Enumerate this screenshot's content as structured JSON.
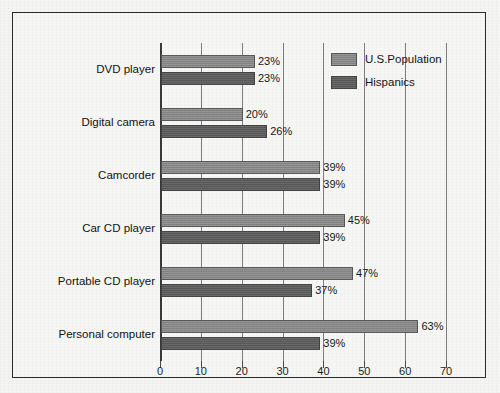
{
  "chart_data": {
    "type": "bar",
    "orientation": "horizontal",
    "title": "",
    "subtitle": "",
    "xlabel": "",
    "ylabel": "",
    "xlim": [
      0,
      70
    ],
    "xticks": [
      0,
      10,
      20,
      30,
      40,
      50,
      60,
      70
    ],
    "xtick_labels": [
      "0",
      "10",
      "20",
      "30",
      "40",
      "50",
      "60",
      "70"
    ],
    "grid": true,
    "grid_axis": "x",
    "legend_position": "top-right",
    "value_label_suffix": "%",
    "categories": [
      "DVD player",
      "Digital camera",
      "Camcorder",
      "Car CD player",
      "Portable CD player",
      "Personal computer"
    ],
    "series": [
      {
        "name": "U.S.Population",
        "color": "#8a8a8a",
        "values": [
          23,
          20,
          39,
          45,
          47,
          63
        ],
        "value_labels": [
          "23%",
          "20%",
          "39%",
          "45%",
          "47%",
          "63%"
        ]
      },
      {
        "name": "Hispanics",
        "color": "#5e5e5e",
        "values": [
          23,
          26,
          39,
          39,
          37,
          39
        ],
        "value_labels": [
          "23%",
          "26%",
          "39%",
          "39%",
          "37%",
          "39%"
        ]
      }
    ]
  },
  "legend": {
    "items": [
      {
        "label": "U.S.Population",
        "color": "#8a8a8a"
      },
      {
        "label": "Hispanics",
        "color": "#5e5e5e"
      }
    ]
  },
  "style": {
    "background": "#f6f6f4",
    "frame_color": "#2b2b2b",
    "gridline_color": "#7d7d7d",
    "axis_color": "#3a3a3a",
    "text_color": "#141414"
  }
}
